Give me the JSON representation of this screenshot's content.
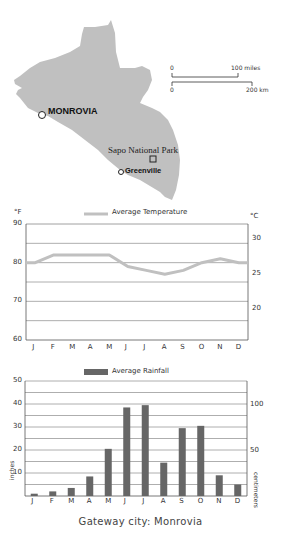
{
  "map": {
    "labels": {
      "capital": "MONROVIA",
      "city": "Greenville",
      "park": "Sapo National Park"
    },
    "scale": {
      "miles_start": "0",
      "miles_end": "100 miles",
      "km_start": "0",
      "km_end": "200 km"
    },
    "land_color": "#c0c0c0"
  },
  "caption": "Gateway city: Monrovia",
  "chart_data": [
    {
      "type": "line",
      "title": "Average Temperature",
      "categories": [
        "J",
        "F",
        "M",
        "A",
        "M",
        "J",
        "J",
        "A",
        "S",
        "O",
        "N",
        "D"
      ],
      "series": [
        {
          "name": "Average Temperature",
          "values": [
            80,
            82,
            82,
            82,
            82,
            79,
            78,
            77,
            78,
            80,
            81,
            80
          ],
          "color": "#c0c0c0"
        }
      ],
      "ylabel_left": "°F",
      "ylabel_right": "°C",
      "ylim": [
        60,
        90
      ],
      "yticks_left": [
        "90",
        "80",
        "70",
        "60"
      ],
      "yticks_right": [
        "30",
        "25",
        "20"
      ],
      "grid": true
    },
    {
      "type": "bar",
      "title": "Average Rainfall",
      "categories": [
        "J",
        "F",
        "M",
        "A",
        "M",
        "J",
        "J",
        "A",
        "S",
        "O",
        "N",
        "D"
      ],
      "series": [
        {
          "name": "Average Rainfall",
          "values": [
            1,
            2,
            3.5,
            8.5,
            20.5,
            38.5,
            39.5,
            14.5,
            29.5,
            30.5,
            9,
            5
          ],
          "color": "#666666"
        }
      ],
      "ylabel_left": "inches",
      "ylabel_right": "centimeters",
      "ylim": [
        0,
        50
      ],
      "yticks_left": [
        "50",
        "40",
        "30",
        "20",
        "10"
      ],
      "yticks_right": [
        "100",
        "50"
      ],
      "grid": true
    }
  ]
}
